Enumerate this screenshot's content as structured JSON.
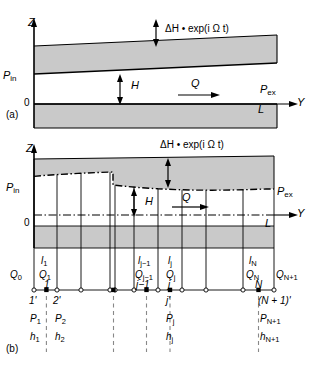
{
  "figure": {
    "panels": [
      {
        "tag": "(a)",
        "axis_vertical_label": "Z",
        "axis_horizontal_label": "Y",
        "origin_label": "0",
        "length_label": "L",
        "inlet_pressure_label": "P_in",
        "exit_pressure_label": "P_ex",
        "gap_label": "H",
        "flow_label": "Q",
        "oscillation_label": "ΔH • exp(i Ω t)"
      },
      {
        "tag": "(b)",
        "axis_vertical_label": "Z",
        "axis_horizontal_label": "Y",
        "origin_label": "0",
        "length_label": "L",
        "inlet_pressure_label": "P_in",
        "exit_pressure_label": "P_ex",
        "gap_label": "H",
        "flow_label": "Q",
        "oscillation_label": "ΔH • exp(i Ω t)"
      }
    ],
    "subscripts": {
      "in": "in",
      "ex": "ex"
    },
    "discretization": {
      "element_labels": [
        "l_1",
        "l_j−1",
        "l_j",
        "l_N"
      ],
      "flow_labels": [
        "Q_0",
        "Q_1",
        "Q_j−1",
        "Q_j",
        "Q_N",
        "Q_N+1"
      ],
      "element_numbers": [
        "1",
        "j−1",
        "j",
        "N"
      ],
      "node_primes": [
        "1'",
        "2'",
        "j'",
        "(N + 1)'"
      ],
      "node_pressures": [
        "P_1",
        "P_2",
        "P_j",
        "P_N+1"
      ],
      "node_gaps": [
        "h_1",
        "h_2",
        "h_j",
        "h_N+1"
      ],
      "ellipsis": "· · ·"
    },
    "colors": {
      "solid_fill": "#c9c9c9",
      "line": "#000000",
      "dash_dot": "#000000",
      "background": "#ffffff"
    }
  }
}
